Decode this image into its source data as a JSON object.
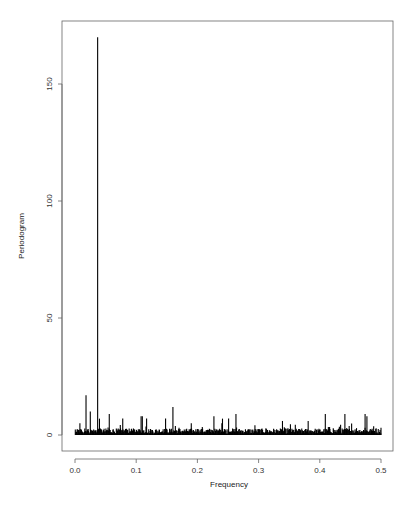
{
  "chart_data": {
    "type": "bar",
    "title": "",
    "xlabel": "Frequency",
    "ylabel": "Periodogram",
    "xlim": [
      0.0,
      0.5
    ],
    "ylim": [
      0,
      170
    ],
    "x_ticks": [
      {
        "value": 0.0,
        "label": "0.0"
      },
      {
        "value": 0.1,
        "label": "0.1"
      },
      {
        "value": 0.2,
        "label": "0.2"
      },
      {
        "value": 0.3,
        "label": "0.3"
      },
      {
        "value": 0.4,
        "label": "0.4"
      },
      {
        "value": 0.5,
        "label": "0.5"
      }
    ],
    "y_ticks": [
      {
        "value": 0,
        "label": "0"
      },
      {
        "value": 50,
        "label": "50"
      },
      {
        "value": 100,
        "label": "100"
      },
      {
        "value": 150,
        "label": "150"
      }
    ],
    "grid": false,
    "legend": null,
    "n_frequencies": 250,
    "dominant_peak": {
      "frequency": 0.037,
      "value": 170
    },
    "notable_peaks": [
      {
        "frequency": 0.018,
        "value": 17
      },
      {
        "frequency": 0.025,
        "value": 10
      },
      {
        "frequency": 0.04,
        "value": 7
      },
      {
        "frequency": 0.056,
        "value": 9
      },
      {
        "frequency": 0.078,
        "value": 7
      },
      {
        "frequency": 0.108,
        "value": 8
      },
      {
        "frequency": 0.11,
        "value": 8
      },
      {
        "frequency": 0.117,
        "value": 7
      },
      {
        "frequency": 0.148,
        "value": 7
      },
      {
        "frequency": 0.16,
        "value": 12
      },
      {
        "frequency": 0.227,
        "value": 8
      },
      {
        "frequency": 0.241,
        "value": 7
      },
      {
        "frequency": 0.251,
        "value": 7
      },
      {
        "frequency": 0.263,
        "value": 9
      },
      {
        "frequency": 0.339,
        "value": 6
      },
      {
        "frequency": 0.381,
        "value": 6
      },
      {
        "frequency": 0.409,
        "value": 9
      },
      {
        "frequency": 0.441,
        "value": 9
      },
      {
        "frequency": 0.474,
        "value": 9
      },
      {
        "frequency": 0.477,
        "value": 8
      }
    ],
    "baseline_noise_max": 5
  },
  "colors": {
    "bars": "#000000",
    "frame": "#555555",
    "background": "#ffffff"
  }
}
